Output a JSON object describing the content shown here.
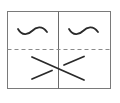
{
  "diagram": {
    "stroke_color": "#2a2a2a",
    "frame_color": "#7a7a7a",
    "dash_color": "#8a8a8a",
    "cells": [
      {
        "id": "top-left",
        "symbol": "wave"
      },
      {
        "id": "top-right",
        "symbol": "wave"
      },
      {
        "id": "bottom",
        "symbol": "crossing-lines"
      }
    ]
  }
}
